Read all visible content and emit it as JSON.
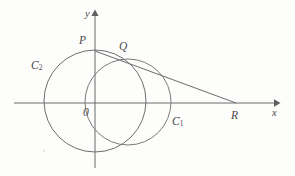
{
  "figure": {
    "kind": "geometry-diagram",
    "background_color": "#fdfdfc",
    "stroke_color": "#6b6b6b",
    "label_color": "#4a4a4a",
    "axes": {
      "x_axis": {
        "label": "x",
        "label_icon": "x-axis-label",
        "y_pixel": 103,
        "x_start": 14,
        "x_end": 278,
        "arrow": "right"
      },
      "y_axis": {
        "label": "y",
        "label_icon": "y-axis-label",
        "x_pixel": 95,
        "y_start": 168,
        "y_end": 12,
        "arrow": "up"
      },
      "origin_label": "0"
    },
    "circles": [
      {
        "name": "C_1",
        "label": "C",
        "subscript": "1",
        "cx": 128,
        "cy": 102,
        "r": 43
      },
      {
        "name": "C_2",
        "label": "C",
        "subscript": "2",
        "cx": 95,
        "cy": 101,
        "r": 51
      }
    ],
    "points": [
      {
        "name": "P",
        "label": "P",
        "x": 95,
        "y": 51
      },
      {
        "name": "Q",
        "label": "Q",
        "x": 123,
        "y": 61
      },
      {
        "name": "R",
        "label": "R",
        "x": 236,
        "y": 103
      },
      {
        "name": "O",
        "label": "0",
        "x": 95,
        "y": 103
      }
    ],
    "line": {
      "name": "PR",
      "from": "P",
      "to": "R",
      "passes_through": "Q"
    }
  }
}
